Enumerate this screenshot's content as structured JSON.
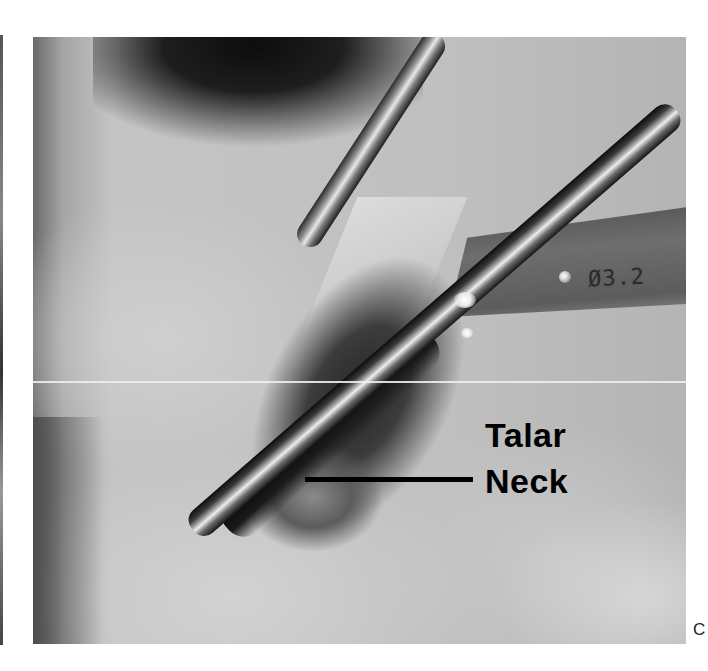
{
  "figure": {
    "panel_letter": "C",
    "photo": {
      "description": "Intraoperative grayscale photograph of talar neck exposure with drill guide and instruments",
      "annotation": {
        "line1": "Talar",
        "line2": "Neck"
      },
      "instrument_etching": "Ø3.2"
    }
  },
  "colors": {
    "label_text": "#000000",
    "background": "#ffffff"
  }
}
